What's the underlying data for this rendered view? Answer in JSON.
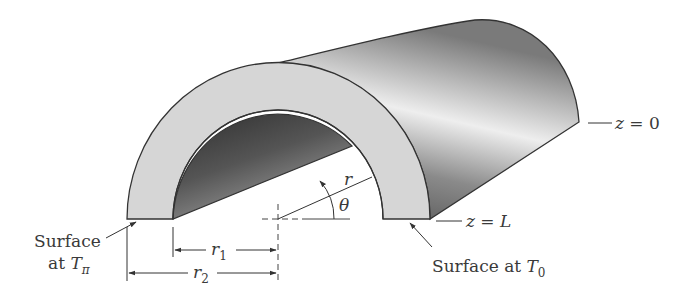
{
  "figure": {
    "colors": {
      "end_face": "#d4d4d4",
      "outer_surface_dark": "#5a5a5a",
      "outer_surface_light": "#e8e8e8",
      "inner_surface_dark": "#3c3c3c",
      "line": "#333333",
      "text": "#3a3a3a"
    }
  },
  "labels": {
    "z0": {
      "prefix": "z",
      "eq": " = ",
      "value": "0"
    },
    "zL": {
      "prefix": "z",
      "eq": " = ",
      "value": "L"
    },
    "r": "r",
    "theta": "θ",
    "r1": {
      "base": "r",
      "sub": "1"
    },
    "r2": {
      "base": "r",
      "sub": "2"
    },
    "surface_left": {
      "line1": "Surface",
      "line2_pre": "at ",
      "T": "T",
      "sub": "π"
    },
    "surface_right": {
      "pre": "Surface at ",
      "T": "T",
      "sub": "0"
    }
  }
}
